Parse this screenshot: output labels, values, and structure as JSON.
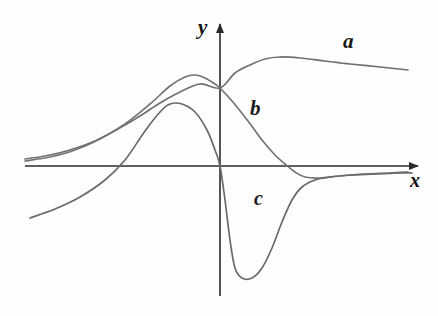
{
  "figure": {
    "width": 438,
    "height": 316,
    "background_color": "#fefefe",
    "curve_color": "#6b6b6b",
    "axis_color": "#2a2a2a",
    "label_color": "#1a1a1a"
  },
  "axes": {
    "x_label": "x",
    "y_label": "y",
    "origin_px": {
      "x": 220,
      "y": 166
    },
    "x_axis": {
      "start_px": 25,
      "end_px": 420,
      "y_px": 166,
      "arrow": "right"
    },
    "y_axis": {
      "start_px": 296,
      "end_px": 22,
      "x_px": 220,
      "arrow": "up"
    }
  },
  "labels": {
    "a": "a",
    "b": "b",
    "c": "c"
  },
  "chart_data": {
    "type": "line",
    "title": "",
    "xlabel": "x",
    "ylabel": "y",
    "grid": false,
    "legend": "inline-curve-labels",
    "xlim": [
      -5,
      5
    ],
    "ylim": [
      -3,
      3
    ],
    "annotations": [
      {
        "text": "a",
        "x_px": 345,
        "y_px": 40
      },
      {
        "text": "b",
        "x_px": 252,
        "y_px": 107
      },
      {
        "text": "c",
        "x_px": 256,
        "y_px": 197
      }
    ],
    "series": [
      {
        "name": "a",
        "label": "a",
        "description": "Broad rising sigmoid-like curve; low flat tail at left just above axis, rises through origin region, peaks near x_px 280 then slowly decays to the right.",
        "points_px": [
          [
            25,
            159
          ],
          [
            45,
            156
          ],
          [
            70,
            150
          ],
          [
            95,
            141
          ],
          [
            118,
            129
          ],
          [
            140,
            116
          ],
          [
            160,
            103
          ],
          [
            180,
            92
          ],
          [
            200,
            84
          ],
          [
            220,
            88
          ],
          [
            235,
            73
          ],
          [
            250,
            65
          ],
          [
            265,
            59
          ],
          [
            280,
            57
          ],
          [
            300,
            58
          ],
          [
            325,
            61
          ],
          [
            350,
            64
          ],
          [
            380,
            67
          ],
          [
            408,
            70
          ]
        ]
      },
      {
        "name": "b",
        "label": "b",
        "description": "Asymmetric peaked curve; flat tail at left, peak near x_px 195, crosses the y-axis descending, crosses the x-axis near x_px 285, shallow minimum near x_px 305 then asymptotic return to axis at right.",
        "points_px": [
          [
            25,
            161
          ],
          [
            50,
            157
          ],
          [
            75,
            150
          ],
          [
            100,
            139
          ],
          [
            125,
            124
          ],
          [
            150,
            104
          ],
          [
            170,
            86
          ],
          [
            185,
            77
          ],
          [
            195,
            75
          ],
          [
            205,
            78
          ],
          [
            215,
            84
          ],
          [
            220,
            88
          ],
          [
            232,
            101
          ],
          [
            248,
            121
          ],
          [
            262,
            140
          ],
          [
            275,
            155
          ],
          [
            285,
            164
          ],
          [
            295,
            172
          ],
          [
            305,
            177
          ],
          [
            320,
            178
          ],
          [
            340,
            176
          ],
          [
            365,
            174
          ],
          [
            390,
            173
          ],
          [
            408,
            172
          ]
        ]
      },
      {
        "name": "c",
        "label": "c",
        "description": "Dispersion-shaped curve; rises from lower-left, small maximum near x_px 170, falls steeply through the y-axis to a deep minimum near x_px 235, then rises back toward the axis on the right.",
        "points_px": [
          [
            30,
            218
          ],
          [
            55,
            209
          ],
          [
            80,
            197
          ],
          [
            105,
            180
          ],
          [
            125,
            160
          ],
          [
            145,
            131
          ],
          [
            160,
            112
          ],
          [
            170,
            104
          ],
          [
            182,
            104
          ],
          [
            195,
            112
          ],
          [
            207,
            130
          ],
          [
            215,
            150
          ],
          [
            220,
            166
          ],
          [
            225,
            200
          ],
          [
            230,
            240
          ],
          [
            235,
            268
          ],
          [
            242,
            278
          ],
          [
            252,
            278
          ],
          [
            262,
            268
          ],
          [
            272,
            248
          ],
          [
            282,
            222
          ],
          [
            292,
            200
          ],
          [
            302,
            187
          ],
          [
            315,
            180
          ],
          [
            330,
            177
          ],
          [
            350,
            175
          ],
          [
            375,
            174
          ],
          [
            400,
            173
          ],
          [
            412,
            173
          ]
        ]
      }
    ]
  }
}
